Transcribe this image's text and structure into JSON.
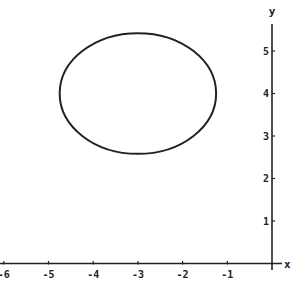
{
  "chart_data": {
    "type": "line",
    "title": "",
    "xlabel": "x",
    "ylabel": "y",
    "xlim": [
      -6.1,
      0.2
    ],
    "ylim": [
      0,
      5.6
    ],
    "grid": false,
    "legend": null,
    "x_ticks": [
      -6,
      -5,
      -4,
      -3,
      -2,
      -1
    ],
    "x_tick_labels": [
      "-6",
      "-5",
      "-4",
      "-3",
      "-2",
      "-1"
    ],
    "y_ticks": [
      1,
      2,
      3,
      4,
      5
    ],
    "y_tick_labels": [
      "1",
      "2",
      "3",
      "4",
      "5"
    ],
    "series": [
      {
        "name": "ellipse",
        "shape": "ellipse",
        "center": [
          -3,
          4
        ],
        "radius_x": 1.75,
        "radius_y": 1.42,
        "x_range": [
          -4.75,
          -1.25
        ],
        "y_range": [
          2.58,
          5.42
        ],
        "color": "#222222"
      }
    ]
  },
  "axes": {
    "x_label": "x",
    "y_label": "y",
    "color": "#222222"
  }
}
